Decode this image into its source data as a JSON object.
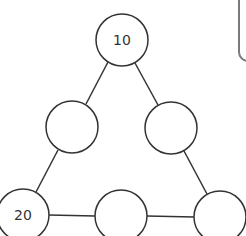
{
  "diagram": {
    "type": "triangle-number-puzzle",
    "stroke_color": "#333333",
    "nodes": [
      {
        "id": "top",
        "label": "10",
        "cx": 122,
        "cy": 40
      },
      {
        "id": "mid-left",
        "label": "",
        "cx": 72,
        "cy": 127
      },
      {
        "id": "mid-right",
        "label": "",
        "cx": 171,
        "cy": 128
      },
      {
        "id": "bottom-left",
        "label": "20",
        "cx": 23,
        "cy": 215
      },
      {
        "id": "bottom-middle",
        "label": "",
        "cx": 121,
        "cy": 216
      },
      {
        "id": "bottom-right",
        "label": "",
        "cx": 220,
        "cy": 217
      }
    ],
    "node_radius": 26,
    "edges": [
      [
        "top",
        "mid-left"
      ],
      [
        "top",
        "mid-right"
      ],
      [
        "mid-left",
        "bottom-left"
      ],
      [
        "mid-right",
        "bottom-right"
      ],
      [
        "bottom-left",
        "bottom-middle"
      ],
      [
        "bottom-middle",
        "bottom-right"
      ]
    ]
  }
}
